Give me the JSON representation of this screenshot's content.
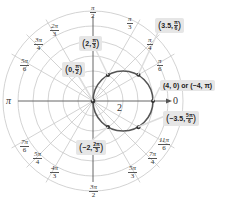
{
  "diagram": {
    "type": "polar-coordinate-grid",
    "colors": {
      "grid": "#c8c8c8",
      "axis": "#555555",
      "curve": "#555555",
      "point": "#333333",
      "callout_bg": "#e6e6e6"
    },
    "center_px": [
      93,
      101
    ],
    "px_per_unit": 15,
    "rings": [
      1,
      2,
      3,
      4,
      5,
      6
    ],
    "radius_label": "2",
    "axis_end_label": "0",
    "curve": {
      "name": "circle r = 4cos(theta)",
      "center": [
        2,
        0
      ],
      "radius": 2
    },
    "angle_labels": [
      {
        "num": "π",
        "den": "2",
        "x": 90,
        "y": 4
      },
      {
        "num": "π",
        "den": "3",
        "x": 127,
        "y": 15
      },
      {
        "num": "π",
        "den": "4",
        "x": 147,
        "y": 36
      },
      {
        "num": "π",
        "den": "6",
        "x": 157,
        "y": 57
      },
      {
        "num": "2π",
        "den": "3",
        "x": 50,
        "y": 22
      },
      {
        "num": "3π",
        "den": "4",
        "x": 34,
        "y": 36
      },
      {
        "num": "5π",
        "den": "6",
        "x": 20,
        "y": 57
      },
      {
        "num": "7π",
        "den": "6",
        "x": 20,
        "y": 138
      },
      {
        "num": "5π",
        "den": "4",
        "x": 33,
        "y": 150
      },
      {
        "num": "4π",
        "den": "3",
        "x": 50,
        "y": 164
      },
      {
        "num": "3π",
        "den": "2",
        "x": 89,
        "y": 183
      },
      {
        "num": "5π",
        "den": "3",
        "x": 128,
        "y": 164
      },
      {
        "num": "7π",
        "den": "4",
        "x": 148,
        "y": 150
      },
      {
        "num": "11π",
        "den": "6",
        "x": 158,
        "y": 136
      }
    ],
    "pi_label": "π",
    "points": [
      {
        "r": 0,
        "theta_deg": 90
      },
      {
        "r": 2,
        "theta_deg": 60
      },
      {
        "r": 3.5,
        "theta_deg": 30
      },
      {
        "r": 4,
        "theta_deg": 0
      },
      {
        "r": 3.5,
        "theta_deg": -30
      },
      {
        "r": 2,
        "theta_deg": -60
      }
    ],
    "callouts": [
      {
        "id": "p1",
        "text": "0,",
        "num": "π",
        "den": "2",
        "x": 62,
        "y": 62
      },
      {
        "id": "p2",
        "text": "2,",
        "num": "π",
        "den": "3",
        "x": 79,
        "y": 36
      },
      {
        "id": "p3",
        "text": "3.5,",
        "num": "π",
        "den": "6",
        "x": 155,
        "y": 18
      },
      {
        "id": "p4",
        "text": "(4, 0) or (−4, π)",
        "x": 160,
        "y": 80
      },
      {
        "id": "p5",
        "text": "−3.5,",
        "num": "5π",
        "den": "6",
        "x": 163,
        "y": 111
      },
      {
        "id": "p6",
        "text": "−2,",
        "num": "2π",
        "den": "3",
        "x": 76,
        "y": 140
      }
    ]
  }
}
